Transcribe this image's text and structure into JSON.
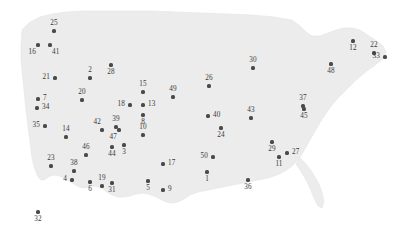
{
  "figure": {
    "type": "map-scatter",
    "background_color": "#ffffff",
    "land_fill": "#ececec",
    "land_stroke": "#e2e2e2",
    "marker_color": "#4a4a4a",
    "label_color": "#3a3a3a",
    "width": 393,
    "height": 244
  },
  "chart_data": {
    "type": "scatter",
    "title": "",
    "subtitle": "",
    "xlabel": "",
    "ylabel": "",
    "basemap": "United States (contiguous 48 states)",
    "legend": "",
    "grid": false,
    "point_count": 50,
    "labels_are": "point index numbers",
    "points": [
      {
        "label": "25",
        "x": 54,
        "y": 31,
        "place": "above"
      },
      {
        "label": "16",
        "x": 38,
        "y": 45,
        "place": "below-left"
      },
      {
        "label": "41",
        "x": 50,
        "y": 45,
        "place": "below-right"
      },
      {
        "label": "21",
        "x": 55,
        "y": 78,
        "place": "left"
      },
      {
        "label": "2",
        "x": 90,
        "y": 78,
        "place": "above"
      },
      {
        "label": "28",
        "x": 111,
        "y": 65,
        "place": "below"
      },
      {
        "label": "20",
        "x": 82,
        "y": 100,
        "place": "above"
      },
      {
        "label": "7",
        "x": 38,
        "y": 99,
        "place": "right"
      },
      {
        "label": "34",
        "x": 37,
        "y": 108,
        "place": "right"
      },
      {
        "label": "35",
        "x": 45,
        "y": 126,
        "place": "left"
      },
      {
        "label": "14",
        "x": 66,
        "y": 137,
        "place": "above"
      },
      {
        "label": "15",
        "x": 143,
        "y": 92,
        "place": "above"
      },
      {
        "label": "18",
        "x": 130,
        "y": 105,
        "place": "left"
      },
      {
        "label": "13",
        "x": 143,
        "y": 105,
        "place": "right"
      },
      {
        "label": "8",
        "x": 143,
        "y": 115,
        "place": "below"
      },
      {
        "label": "49",
        "x": 173,
        "y": 97,
        "place": "above"
      },
      {
        "label": "10",
        "x": 143,
        "y": 135,
        "place": "above"
      },
      {
        "label": "42",
        "x": 102,
        "y": 130,
        "place": "above-left"
      },
      {
        "label": "39",
        "x": 116,
        "y": 127,
        "place": "above"
      },
      {
        "label": "47",
        "x": 119,
        "y": 130,
        "place": "below-left"
      },
      {
        "label": "44",
        "x": 112,
        "y": 147,
        "place": "below"
      },
      {
        "label": "3",
        "x": 124,
        "y": 145,
        "place": "below"
      },
      {
        "label": "46",
        "x": 86,
        "y": 155,
        "place": "above"
      },
      {
        "label": "23",
        "x": 51,
        "y": 166,
        "place": "above"
      },
      {
        "label": "38",
        "x": 74,
        "y": 171,
        "place": "above"
      },
      {
        "label": "4",
        "x": 72,
        "y": 180,
        "place": "left"
      },
      {
        "label": "6",
        "x": 90,
        "y": 182,
        "place": "below"
      },
      {
        "label": "19",
        "x": 102,
        "y": 186,
        "place": "above"
      },
      {
        "label": "31",
        "x": 112,
        "y": 183,
        "place": "below"
      },
      {
        "label": "32",
        "x": 38,
        "y": 212,
        "place": "below"
      },
      {
        "label": "5",
        "x": 148,
        "y": 181,
        "place": "below"
      },
      {
        "label": "17",
        "x": 163,
        "y": 164,
        "place": "right"
      },
      {
        "label": "9",
        "x": 163,
        "y": 190,
        "place": "right"
      },
      {
        "label": "26",
        "x": 209,
        "y": 86,
        "place": "above"
      },
      {
        "label": "30",
        "x": 253,
        "y": 68,
        "place": "above"
      },
      {
        "label": "40",
        "x": 208,
        "y": 116,
        "place": "right"
      },
      {
        "label": "43",
        "x": 251,
        "y": 118,
        "place": "above"
      },
      {
        "label": "24",
        "x": 221,
        "y": 128,
        "place": "below"
      },
      {
        "label": "37",
        "x": 303,
        "y": 106,
        "place": "above"
      },
      {
        "label": "45",
        "x": 304,
        "y": 109,
        "place": "below"
      },
      {
        "label": "29",
        "x": 272,
        "y": 142,
        "place": "below"
      },
      {
        "label": "27",
        "x": 287,
        "y": 153,
        "place": "right"
      },
      {
        "label": "11",
        "x": 279,
        "y": 157,
        "place": "below"
      },
      {
        "label": "50",
        "x": 213,
        "y": 157,
        "place": "left"
      },
      {
        "label": "1",
        "x": 207,
        "y": 172,
        "place": "below"
      },
      {
        "label": "36",
        "x": 248,
        "y": 180,
        "place": "below"
      },
      {
        "label": "48",
        "x": 331,
        "y": 64,
        "place": "below"
      },
      {
        "label": "12",
        "x": 353,
        "y": 41,
        "place": "below"
      },
      {
        "label": "22",
        "x": 374,
        "y": 53,
        "place": "above"
      },
      {
        "label": "33",
        "x": 385,
        "y": 57,
        "place": "left"
      }
    ]
  }
}
